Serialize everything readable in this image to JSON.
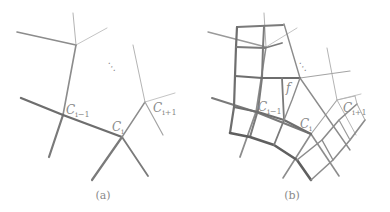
{
  "figure": {
    "panels": [
      {
        "id": "a",
        "caption": "(a)",
        "labels": {
          "c_prev": {
            "main": "C",
            "sub": "i−1"
          },
          "c_cur": {
            "main": "C",
            "sub": "i"
          },
          "c_next": {
            "main": "C",
            "sub": "i+1"
          },
          "ellipsis": "⋱"
        }
      },
      {
        "id": "b",
        "caption": "(b)",
        "labels": {
          "face": "f",
          "c_prev": {
            "main": "C",
            "sub": "i−1"
          },
          "c_cur": {
            "main": "C",
            "sub": "i"
          },
          "c_next": {
            "main": "C",
            "sub": "i+1"
          },
          "ellipsis": "⋱"
        }
      }
    ],
    "colors": {
      "thick": "#6e6e6e",
      "medium": "#8c8c8c",
      "thin": "#b4b4b4",
      "text": "#8a8a8a"
    }
  }
}
